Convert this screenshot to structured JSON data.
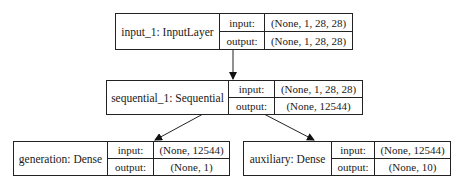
{
  "diagram": {
    "type": "keras-model-plot",
    "nodes": [
      {
        "id": "input_1",
        "name": "input_1: InputLayer",
        "input_label": "input:",
        "output_label": "output:",
        "input_shape": "(None, 1, 28, 28)",
        "output_shape": "(None, 1, 28, 28)"
      },
      {
        "id": "sequential_1",
        "name": "sequential_1: Sequential",
        "input_label": "input:",
        "output_label": "output:",
        "input_shape": "(None, 1, 28, 28)",
        "output_shape": "(None, 12544)"
      },
      {
        "id": "generation",
        "name": "generation: Dense",
        "input_label": "input:",
        "output_label": "output:",
        "input_shape": "(None, 12544)",
        "output_shape": "(None, 1)"
      },
      {
        "id": "auxiliary",
        "name": "auxiliary: Dense",
        "input_label": "input:",
        "output_label": "output:",
        "input_shape": "(None, 12544)",
        "output_shape": "(None, 10)"
      }
    ],
    "edges": [
      {
        "from": "input_1",
        "to": "sequential_1"
      },
      {
        "from": "sequential_1",
        "to": "generation"
      },
      {
        "from": "sequential_1",
        "to": "auxiliary"
      }
    ],
    "colors": {
      "line": "#222222",
      "background": "#ffffff"
    }
  }
}
